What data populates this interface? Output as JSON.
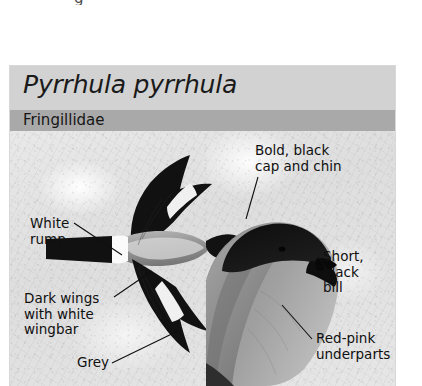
{
  "page": {
    "clipped_fragment": "g"
  },
  "card": {
    "species_name": "Pyrrhula pyrrhula",
    "family_name": "Fringillidae",
    "colors": {
      "title_band": "#d2d2d2",
      "family_band": "#a9a9a9",
      "photo_background": "#e3e3e3",
      "plumage_black": "#101010",
      "plumage_grey": "#8e8e8e",
      "plumage_white": "#f2f2f2"
    },
    "annotations": [
      {
        "name": "cap-and-chin",
        "lines": [
          "Bold, black",
          "cap and chin"
        ],
        "text": "Bold, black cap and chin",
        "target": "black cap of perched bird"
      },
      {
        "name": "white-rump",
        "lines": [
          "White",
          "rump"
        ],
        "text": "White rump",
        "target": "white rump band of flying bird"
      },
      {
        "name": "dark-wings",
        "lines": [
          "Dark wings",
          "with white",
          "wingbar"
        ],
        "text": "Dark wings with white wingbar",
        "target": "black wing with white wingbar"
      },
      {
        "name": "short-black-bill",
        "lines": [
          "Short,",
          "black",
          "bill"
        ],
        "text": "Short, black bill",
        "target": "bill of perched bird"
      },
      {
        "name": "red-pink-underparts",
        "lines": [
          "Red-pink",
          "underparts"
        ],
        "text": "Red-pink underparts",
        "target": "breast of perched bird"
      },
      {
        "name": "grey-back",
        "lines": [
          "Grey"
        ],
        "text": "Grey",
        "target": "mantle of perched bird"
      }
    ],
    "illustrations": [
      {
        "name": "flying-bullfinch",
        "description": "Bullfinch in flight, dorsal view, showing black tail, white rump, grey back, black wings with white wingbars"
      },
      {
        "name": "perched-bullfinch",
        "description": "Close-up of perched bullfinch head and body showing black cap, short black bill, grey mantle"
      }
    ]
  }
}
